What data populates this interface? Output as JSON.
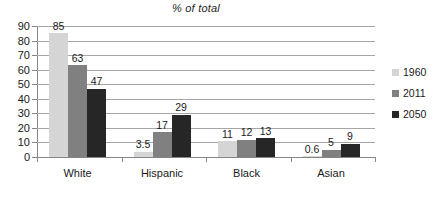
{
  "chart_data": {
    "type": "bar",
    "title": "% of total",
    "xlabel": "",
    "ylabel": "",
    "ylim": [
      0,
      90
    ],
    "ytick_step": 10,
    "yticks": [
      "0",
      "10",
      "20",
      "30",
      "40",
      "50",
      "60",
      "70",
      "80",
      "90"
    ],
    "grid": true,
    "legend_position": "right",
    "categories": [
      "White",
      "Hispanic",
      "Black",
      "Asian"
    ],
    "series": [
      {
        "name": "1960",
        "color": "#d5d5d5",
        "values": [
          85,
          3.5,
          11,
          0.6
        ],
        "labels": [
          "85",
          "3.5",
          "11",
          "0.6"
        ]
      },
      {
        "name": "2011",
        "color": "#808080",
        "values": [
          63,
          17,
          12,
          5
        ],
        "labels": [
          "63",
          "17",
          "12",
          "5"
        ]
      },
      {
        "name": "2050",
        "color": "#262626",
        "values": [
          47,
          29,
          13,
          9
        ],
        "labels": [
          "47",
          "29",
          "13",
          "9"
        ]
      }
    ]
  },
  "legend": {
    "entries": [
      {
        "label": "1960",
        "color": "#d5d5d5"
      },
      {
        "label": "2011",
        "color": "#808080"
      },
      {
        "label": "2050",
        "color": "#262626"
      }
    ]
  },
  "colors": {
    "series_1960": "#d5d5d5",
    "series_2011": "#808080",
    "series_2050": "#262626",
    "gridline": "#a6a6a6",
    "axis": "#868686",
    "text": "#1a1a1a",
    "background": "#ffffff"
  },
  "bottom_artifact": ""
}
